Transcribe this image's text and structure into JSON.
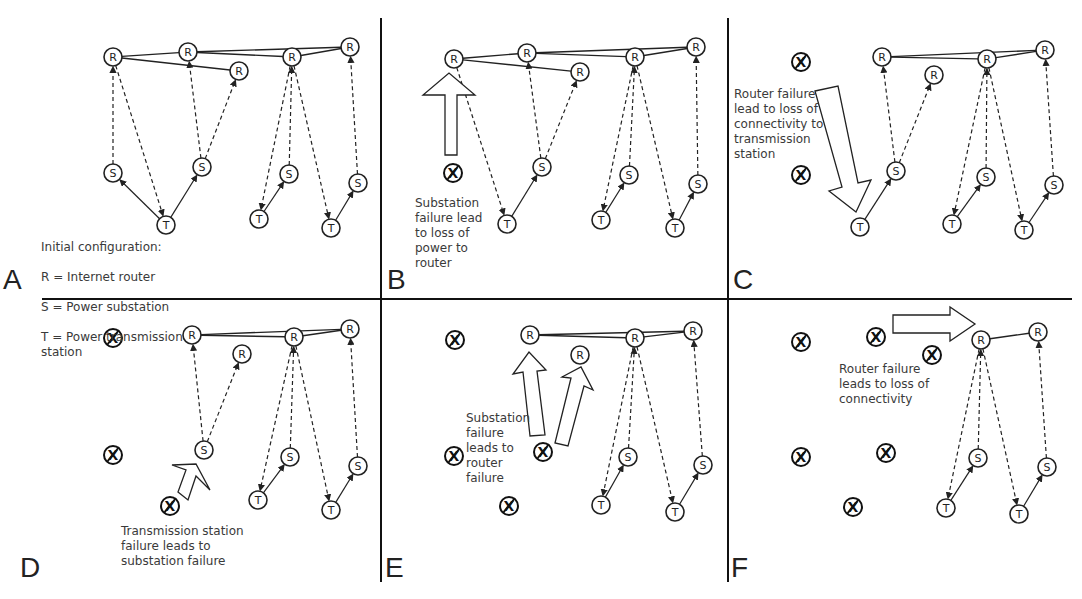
{
  "figure": {
    "legend": {
      "title": "Initial configuration:",
      "lines": [
        "R = Internet router",
        "S = Power substation",
        "T = Power transmission\nstation"
      ]
    },
    "node_labels": {
      "router": "R",
      "substation": "S",
      "transmission": "T",
      "failed": "X"
    },
    "panels": [
      {
        "id": "A",
        "caption": "",
        "routers": [
          [
            113,
            57
          ],
          [
            188,
            52
          ],
          [
            292,
            57
          ],
          [
            350,
            47
          ],
          [
            239,
            71
          ]
        ],
        "substations": [
          [
            113,
            173
          ],
          [
            202,
            167
          ],
          [
            289,
            174
          ],
          [
            358,
            183
          ]
        ],
        "transmissions": [
          [
            166,
            225
          ],
          [
            259,
            219
          ],
          [
            331,
            228
          ]
        ],
        "failed": [],
        "router_links": [
          [
            0,
            1
          ],
          [
            1,
            2
          ],
          [
            2,
            3
          ],
          [
            1,
            3
          ],
          [
            0,
            4
          ]
        ],
        "power_links": [
          [
            [
              166,
              225
            ],
            [
              113,
              173
            ]
          ],
          [
            [
              166,
              225
            ],
            [
              202,
              167
            ]
          ],
          [
            [
              259,
              219
            ],
            [
              289,
              174
            ]
          ],
          [
            [
              331,
              228
            ],
            [
              358,
              183
            ]
          ]
        ],
        "data_links": [
          [
            [
              113,
              173
            ],
            [
              113,
              57
            ]
          ],
          [
            [
              113,
              57
            ],
            [
              166,
              225
            ]
          ],
          [
            [
              202,
              167
            ],
            [
              188,
              52
            ]
          ],
          [
            [
              202,
              167
            ],
            [
              239,
              71
            ]
          ],
          [
            [
              292,
              57
            ],
            [
              259,
              219
            ]
          ],
          [
            [
              289,
              174
            ],
            [
              292,
              57
            ]
          ],
          [
            [
              292,
              57
            ],
            [
              331,
              228
            ]
          ],
          [
            [
              358,
              183
            ],
            [
              350,
              47
            ]
          ]
        ],
        "arrows": []
      },
      {
        "id": "B",
        "caption": "Substation\nfailure lead\nto loss of\npower to\nrouter",
        "routers": [
          [
            454,
            59
          ],
          [
            527,
            53
          ],
          [
            635,
            57
          ],
          [
            696,
            47
          ],
          [
            580,
            72
          ]
        ],
        "substations": [
          [
            542,
            167
          ],
          [
            629,
            175
          ],
          [
            698,
            184
          ]
        ],
        "transmissions": [
          [
            507,
            224
          ],
          [
            601,
            220
          ],
          [
            675,
            228
          ]
        ],
        "failed": [
          [
            453,
            173
          ]
        ],
        "router_links": [
          [
            0,
            1
          ],
          [
            1,
            2
          ],
          [
            2,
            3
          ],
          [
            1,
            3
          ],
          [
            0,
            4
          ]
        ],
        "power_links": [
          [
            [
              507,
              224
            ],
            [
              542,
              167
            ]
          ],
          [
            [
              601,
              220
            ],
            [
              629,
              175
            ]
          ],
          [
            [
              675,
              228
            ],
            [
              698,
              184
            ]
          ]
        ],
        "data_links": [
          [
            [
              454,
              59
            ],
            [
              507,
              224
            ]
          ],
          [
            [
              542,
              167
            ],
            [
              527,
              53
            ]
          ],
          [
            [
              542,
              167
            ],
            [
              580,
              72
            ]
          ],
          [
            [
              635,
              57
            ],
            [
              601,
              220
            ]
          ],
          [
            [
              629,
              175
            ],
            [
              635,
              57
            ]
          ],
          [
            [
              635,
              57
            ],
            [
              675,
              228
            ]
          ],
          [
            [
              698,
              184
            ],
            [
              696,
              47
            ]
          ]
        ],
        "arrows": [
          {
            "type": "up",
            "x": 447,
            "y": 75,
            "w": 48,
            "h": 80
          }
        ]
      },
      {
        "id": "C",
        "caption": "Router failure\nlead to loss of\nconnectivity to\ntransmission\nstation",
        "routers": [
          [
            882,
            57
          ],
          [
            987,
            59
          ],
          [
            1045,
            50
          ],
          [
            934,
            75
          ]
        ],
        "substations": [
          [
            896,
            171
          ],
          [
            986,
            177
          ],
          [
            1054,
            185
          ]
        ],
        "transmissions": [
          [
            860,
            227
          ],
          [
            952,
            224
          ],
          [
            1024,
            230
          ]
        ],
        "failed": [
          [
            801,
            62
          ],
          [
            801,
            175
          ]
        ],
        "router_links": [
          [
            0,
            1
          ],
          [
            1,
            2
          ],
          [
            0,
            2
          ]
        ],
        "power_links": [
          [
            [
              860,
              227
            ],
            [
              896,
              171
            ]
          ],
          [
            [
              952,
              224
            ],
            [
              986,
              177
            ]
          ],
          [
            [
              1024,
              230
            ],
            [
              1054,
              185
            ]
          ]
        ],
        "data_links": [
          [
            [
              896,
              171
            ],
            [
              882,
              57
            ]
          ],
          [
            [
              896,
              171
            ],
            [
              934,
              75
            ]
          ],
          [
            [
              987,
              59
            ],
            [
              952,
              224
            ]
          ],
          [
            [
              986,
              177
            ],
            [
              987,
              59
            ]
          ],
          [
            [
              987,
              59
            ],
            [
              1024,
              230
            ]
          ],
          [
            [
              1054,
              185
            ],
            [
              1045,
              50
            ]
          ]
        ],
        "arrows": [
          {
            "type": "down-diag"
          }
        ]
      },
      {
        "id": "D",
        "caption": "Transmission station\nfailure leads to\nsubstation failure",
        "routers": [
          [
            192,
            335
          ],
          [
            294,
            337
          ],
          [
            350,
            329
          ],
          [
            242,
            354
          ]
        ],
        "substations": [
          [
            204,
            450
          ],
          [
            290,
            457
          ],
          [
            358,
            466
          ]
        ],
        "transmissions": [
          [
            258,
            500
          ],
          [
            331,
            510
          ]
        ],
        "failed": [
          [
            113,
            338
          ],
          [
            113,
            455
          ],
          [
            170,
            506
          ]
        ],
        "router_links": [
          [
            0,
            1
          ],
          [
            1,
            2
          ],
          [
            0,
            2
          ]
        ],
        "power_links": [
          [
            [
              258,
              500
            ],
            [
              290,
              457
            ]
          ],
          [
            [
              331,
              510
            ],
            [
              358,
              466
            ]
          ]
        ],
        "data_links": [
          [
            [
              204,
              450
            ],
            [
              192,
              335
            ]
          ],
          [
            [
              204,
              450
            ],
            [
              242,
              354
            ]
          ],
          [
            [
              294,
              337
            ],
            [
              258,
              500
            ]
          ],
          [
            [
              290,
              457
            ],
            [
              294,
              337
            ]
          ],
          [
            [
              294,
              337
            ],
            [
              331,
              510
            ]
          ],
          [
            [
              358,
              466
            ],
            [
              350,
              329
            ]
          ]
        ],
        "arrows": [
          {
            "type": "up-right-diag"
          }
        ]
      },
      {
        "id": "E",
        "caption": "Substation\nfailure\nleads to\nrouter\nfailure",
        "routers": [
          [
            530,
            335
          ],
          [
            635,
            338
          ],
          [
            693,
            331
          ],
          [
            580,
            355
          ]
        ],
        "substations": [
          [
            628,
            457
          ],
          [
            703,
            465
          ]
        ],
        "transmissions": [
          [
            601,
            505
          ],
          [
            675,
            512
          ]
        ],
        "failed": [
          [
            455,
            340
          ],
          [
            454,
            456
          ],
          [
            543,
            452
          ],
          [
            509,
            506
          ]
        ],
        "router_links": [
          [
            0,
            1
          ],
          [
            1,
            2
          ],
          [
            0,
            2
          ]
        ],
        "power_links": [
          [
            [
              601,
              505
            ],
            [
              628,
              457
            ]
          ],
          [
            [
              675,
              512
            ],
            [
              703,
              465
            ]
          ]
        ],
        "data_links": [
          [
            [
              635,
              338
            ],
            [
              601,
              505
            ]
          ],
          [
            [
              628,
              457
            ],
            [
              635,
              338
            ]
          ],
          [
            [
              635,
              338
            ],
            [
              675,
              512
            ]
          ],
          [
            [
              703,
              465
            ],
            [
              693,
              331
            ]
          ]
        ],
        "arrows": [
          {
            "type": "up-two"
          }
        ]
      },
      {
        "id": "F",
        "caption": "Router failure\nleads to loss of\nconnectivity",
        "routers": [
          [
            981,
            340
          ],
          [
            1038,
            332
          ]
        ],
        "substations": [
          [
            978,
            458
          ],
          [
            1047,
            467
          ]
        ],
        "transmissions": [
          [
            946,
            508
          ],
          [
            1019,
            514
          ]
        ],
        "failed": [
          [
            801,
            342
          ],
          [
            876,
            337
          ],
          [
            932,
            355
          ],
          [
            801,
            457
          ],
          [
            886,
            453
          ],
          [
            853,
            507
          ]
        ],
        "router_links": [
          [
            0,
            1
          ]
        ],
        "power_links": [
          [
            [
              946,
              508
            ],
            [
              978,
              458
            ]
          ],
          [
            [
              1019,
              514
            ],
            [
              1047,
              467
            ]
          ]
        ],
        "data_links": [
          [
            [
              981,
              340
            ],
            [
              946,
              508
            ]
          ],
          [
            [
              978,
              458
            ],
            [
              981,
              340
            ]
          ],
          [
            [
              981,
              340
            ],
            [
              1019,
              514
            ]
          ],
          [
            [
              1047,
              467
            ],
            [
              1038,
              332
            ]
          ]
        ],
        "arrows": [
          {
            "type": "right"
          }
        ]
      }
    ]
  }
}
